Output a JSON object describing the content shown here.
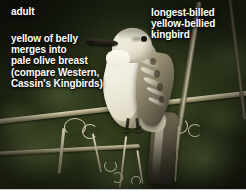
{
  "plate": {
    "subject": "Tropical Kingbird perched on wire",
    "annotations": {
      "age_label": "adult",
      "left_note": "yellow of belly\nmerges into\npale olive breast\n(compare Western,\nCassin's Kingbirds)",
      "right_note": "longest-billed\nyellow-bellied\nkingbird"
    },
    "colors": {
      "caption_text": "#ffffff",
      "background_foliage": "#2a3319",
      "background_dark": "#1b2212",
      "branch": "#cfc8ae",
      "bird_underparts": "#f2efe4",
      "bird_head": "#e9e4d3",
      "bird_wing": "#7e7660",
      "bird_tail": "#3a3629",
      "bill": "#201d15",
      "eye": "#14120c",
      "bottom_strip": "#ffffff"
    }
  }
}
